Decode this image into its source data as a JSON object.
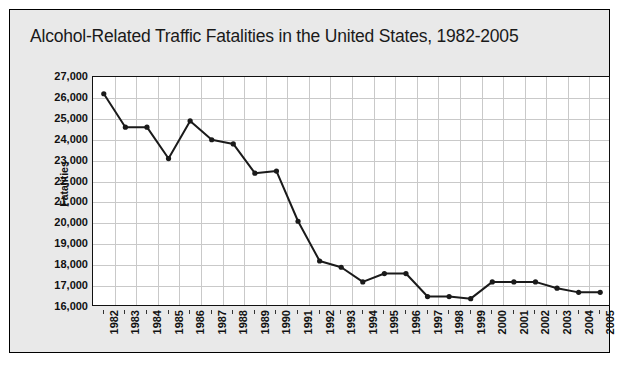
{
  "chart_data": {
    "type": "line",
    "title": "Alcohol-Related Traffic Fatalities in the United States, 1982-2005",
    "xlabel": "",
    "ylabel": "Fatalities",
    "categories": [
      "1982",
      "1983",
      "1984",
      "1985",
      "1986",
      "1987",
      "1988",
      "1989",
      "1990",
      "1991",
      "1992",
      "1993",
      "1994",
      "1995",
      "1996",
      "1997",
      "1998",
      "1999",
      "2000",
      "2001",
      "2002",
      "2003",
      "2004",
      "2005"
    ],
    "values": [
      26200,
      24600,
      24600,
      23100,
      24900,
      24000,
      23800,
      22400,
      22500,
      20100,
      18200,
      17900,
      17200,
      17600,
      17600,
      16500,
      16500,
      16400,
      17200,
      17200,
      17200,
      16900,
      16700,
      16700
    ],
    "ylim": [
      16000,
      27000
    ],
    "ytick_step": 1000,
    "ytick_labels": [
      "27,000",
      "26,000",
      "25,000",
      "24,000",
      "23,000",
      "22,000",
      "21,000",
      "20,000",
      "19,000",
      "18,000",
      "17,000",
      "16,000"
    ],
    "ytick_values": [
      27000,
      26000,
      25000,
      24000,
      23000,
      22000,
      21000,
      20000,
      19000,
      18000,
      17000,
      16000
    ],
    "grid": true,
    "legend": null,
    "series_color": "#1a1a1a",
    "marker": "circle"
  },
  "figure": {
    "source_note": ""
  },
  "colors": {
    "panel_background": "#e9e9e9",
    "plot_background": "#ffffff",
    "grid": "#c9c9c9",
    "axis": "#111111",
    "line": "#1a1a1a",
    "text": "#111111"
  }
}
